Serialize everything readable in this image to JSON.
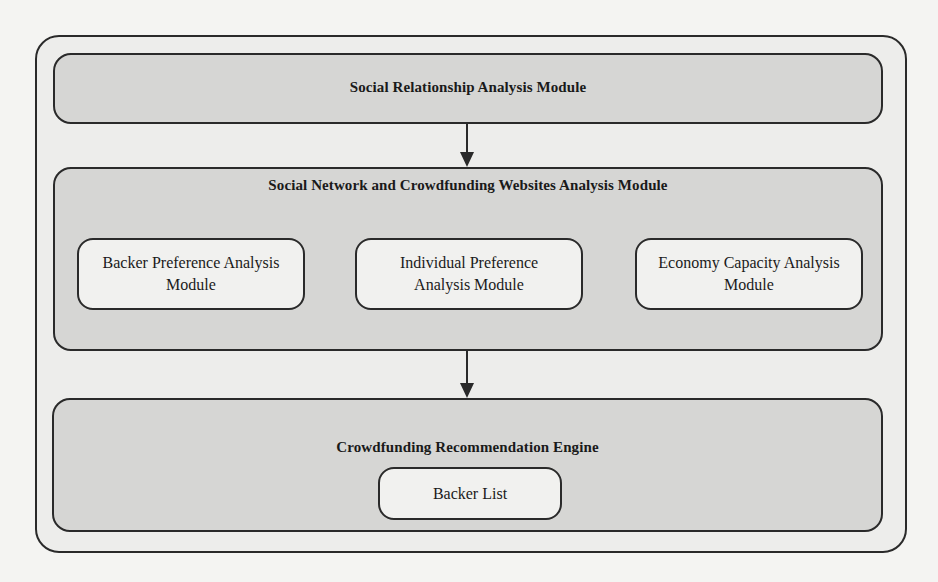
{
  "diagram": {
    "type": "layered-architecture",
    "colors": {
      "outer_fill": "#ededeb",
      "module_fill": "#d6d6d4",
      "submodule_fill": "#f1f1ef",
      "stroke": "#2a2a2a"
    },
    "modules": [
      {
        "id": "social-relationship",
        "title": "Social Relationship Analysis Module",
        "children": []
      },
      {
        "id": "social-network-crowdfunding",
        "title": "Social Network and Crowdfunding Websites Analysis Module",
        "children": [
          {
            "label_line1": "Backer Preference Analysis",
            "label_line2": "Module"
          },
          {
            "label_line1": "Individual Preference",
            "label_line2": "Analysis Module"
          },
          {
            "label_line1": "Economy Capacity Analysis",
            "label_line2": "Module"
          }
        ]
      },
      {
        "id": "recommendation-engine",
        "title": "Crowdfunding Recommendation Engine",
        "children": [
          {
            "label_line1": "Backer List"
          }
        ]
      }
    ],
    "edges": [
      {
        "from": "Social Relationship Analysis Module",
        "to": "Social Network and Crowdfunding Websites Analysis Module",
        "style": "arrow"
      },
      {
        "from": "Social Network and Crowdfunding Websites Analysis Module",
        "to": "Crowdfunding Recommendation Engine",
        "style": "arrow"
      }
    ]
  }
}
